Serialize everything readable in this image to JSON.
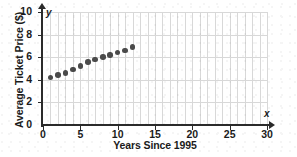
{
  "chart_data": {
    "type": "scatter",
    "title": "",
    "xlabel": "Years Since 1995",
    "ylabel": "Average Ticket Price ($)",
    "axis_letter_x": "x",
    "axis_letter_y": "y",
    "xlim": [
      0,
      30
    ],
    "ylim": [
      0,
      10
    ],
    "xticks": [
      0,
      5,
      10,
      15,
      20,
      25,
      30
    ],
    "xtick_labels": [
      "0",
      "5",
      "10",
      "15",
      "20",
      "25",
      "30"
    ],
    "yticks": [
      0,
      2,
      4,
      6,
      8,
      10
    ],
    "ytick_labels": [
      "0",
      "2",
      "4",
      "6",
      "8",
      "10"
    ],
    "grid": true,
    "grid_x_step": 1,
    "grid_y_step": 2,
    "legend": null,
    "point_color": "#4a4a4a",
    "axis_color": "#2b2b2b",
    "grid_color": "#d8d8d8",
    "x": [
      1,
      2,
      3,
      4,
      5,
      6,
      7,
      8,
      9,
      10,
      11,
      12
    ],
    "y": [
      4.2,
      4.4,
      4.6,
      4.9,
      5.2,
      5.6,
      5.8,
      6.0,
      6.2,
      6.4,
      6.6,
      6.9
    ],
    "points": [
      {
        "x": 1,
        "y": 4.2
      },
      {
        "x": 2,
        "y": 4.4
      },
      {
        "x": 3,
        "y": 4.6
      },
      {
        "x": 4,
        "y": 4.9
      },
      {
        "x": 5,
        "y": 5.2
      },
      {
        "x": 6,
        "y": 5.6
      },
      {
        "x": 7,
        "y": 5.8
      },
      {
        "x": 8,
        "y": 6.0
      },
      {
        "x": 9,
        "y": 6.2
      },
      {
        "x": 10,
        "y": 6.4
      },
      {
        "x": 11,
        "y": 6.6
      },
      {
        "x": 12,
        "y": 6.9
      }
    ]
  }
}
